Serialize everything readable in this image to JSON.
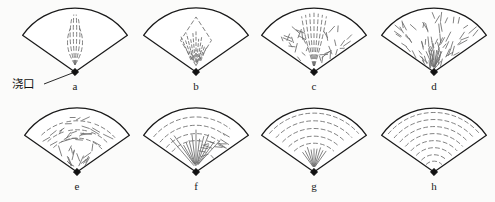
{
  "figure": {
    "background_color": "#fbfbfa",
    "outline_color": "#1a1a1a",
    "flow_line_color": "#6b6b6b",
    "gate_marker_color": "#111111",
    "width": 495,
    "height": 202
  },
  "callout": {
    "label": "浇口",
    "meaning": "gate",
    "label_x": 12,
    "label_y": 88,
    "leader_from_x": 44,
    "leader_from_y": 84,
    "leader_to_x": 75,
    "leader_to_y": 72
  },
  "sectors": [
    {
      "id": "a",
      "label": "a",
      "apex_x": 75,
      "apex_y": 72,
      "radius": 64,
      "half_angle_deg": 55,
      "label_x": 75,
      "label_y": 90,
      "pattern": "narrow-spindle",
      "pattern_description": "narrow vertical spindle of long dashed lines directly above the gate"
    },
    {
      "id": "b",
      "label": "b",
      "apex_x": 196,
      "apex_y": 72,
      "radius": 64,
      "half_angle_deg": 55,
      "label_x": 196,
      "label_y": 90,
      "pattern": "diamond-burst",
      "pattern_description": "diamond / rhombus outline with short radiating lines inside"
    },
    {
      "id": "c",
      "label": "c",
      "apex_x": 314,
      "apex_y": 72,
      "radius": 64,
      "half_angle_deg": 55,
      "label_x": 314,
      "label_y": 90,
      "pattern": "central-band-scatter",
      "pattern_description": "central radial band of long lines flanked by scattered short dashes"
    },
    {
      "id": "d",
      "label": "d",
      "apex_x": 434,
      "apex_y": 72,
      "radius": 64,
      "half_angle_deg": 55,
      "label_x": 434,
      "label_y": 90,
      "pattern": "dense-radial-scatter",
      "pattern_description": "dense scattered short dashes fanning radially across whole sector"
    },
    {
      "id": "e",
      "label": "e",
      "apex_x": 77,
      "apex_y": 172,
      "radius": 64,
      "half_angle_deg": 55,
      "label_x": 77,
      "label_y": 190,
      "pattern": "arc-outer-scatter-inner",
      "pattern_description": "broken curved arcs in the outer zone, scattered dashes near the gate"
    },
    {
      "id": "f",
      "label": "f",
      "apex_x": 196,
      "apex_y": 172,
      "radius": 64,
      "half_angle_deg": 55,
      "label_x": 196,
      "label_y": 190,
      "pattern": "arc-outer-radial-inner",
      "pattern_description": "concentric arcs in the outer zone, radial lines near the gate"
    },
    {
      "id": "g",
      "label": "g",
      "apex_x": 314,
      "apex_y": 172,
      "radius": 64,
      "half_angle_deg": 55,
      "label_x": 314,
      "label_y": 190,
      "pattern": "strong-arcs-radial-core",
      "pattern_description": "well defined concentric dashed arcs with a small radial core at the gate"
    },
    {
      "id": "h",
      "label": "h",
      "apex_x": 434,
      "apex_y": 172,
      "radius": 64,
      "half_angle_deg": 55,
      "label_x": 434,
      "label_y": 190,
      "pattern": "full-concentric-arcs",
      "pattern_description": "uniform concentric dashed arcs filling the entire sector"
    }
  ]
}
